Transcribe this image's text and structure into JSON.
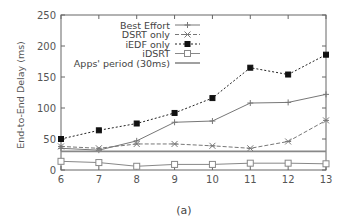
{
  "chart_data": {
    "type": "line",
    "title": "",
    "caption": "(a)",
    "xlabel": "",
    "ylabel": "End-to-End Delay (ms)",
    "x": [
      6,
      7,
      8,
      9,
      10,
      11,
      12,
      13
    ],
    "xlim": [
      6,
      13
    ],
    "ylim": [
      0,
      250
    ],
    "yticks": [
      0,
      50,
      100,
      150,
      200,
      250
    ],
    "xticks": [
      6,
      7,
      8,
      9,
      10,
      11,
      12,
      13
    ],
    "grid": false,
    "legend_position": "top-left inside",
    "series": [
      {
        "name": "Best Effort",
        "style": "solid",
        "marker": "plus",
        "color": "#777777",
        "values": [
          35,
          32,
          47,
          77,
          79,
          108,
          109,
          122
        ]
      },
      {
        "name": "DSRT only",
        "style": "dashed",
        "marker": "x",
        "color": "#777777",
        "values": [
          38,
          35,
          42,
          42,
          39,
          35,
          46,
          80
        ]
      },
      {
        "name": "iEDF only",
        "style": "dotted",
        "marker": "filled-square",
        "color": "#222222",
        "values": [
          50,
          64,
          75,
          92,
          116,
          165,
          154,
          186
        ]
      },
      {
        "name": "iDSRT",
        "style": "solid",
        "marker": "open-square",
        "color": "#888888",
        "values": [
          14,
          12,
          6,
          9,
          9,
          11,
          11,
          10
        ]
      },
      {
        "name": "Apps' period (30ms)",
        "style": "solid-thick",
        "marker": "none",
        "color": "#888888",
        "values": [
          30,
          30,
          30,
          30,
          30,
          30,
          30,
          30
        ]
      }
    ]
  }
}
